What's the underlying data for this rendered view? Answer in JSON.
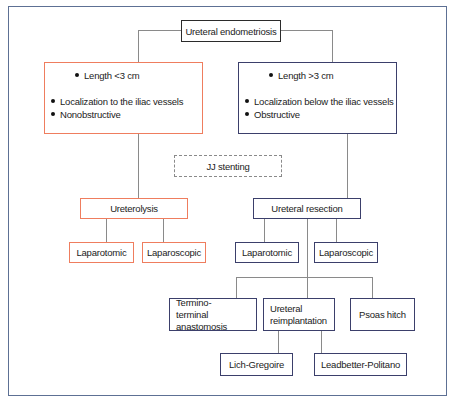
{
  "diagram": {
    "title": "Ureteral endometriosis",
    "left_branch": {
      "criteria": [
        "Length <3 cm",
        "Localization to the iliac vessels",
        "Nonobstructive"
      ],
      "color": "#ef7d5e",
      "treatment": "Ureterolysis",
      "approaches": [
        "Laparotomic",
        "Laparoscopic"
      ]
    },
    "right_branch": {
      "criteria": [
        "Length >3 cm",
        "Localization below the iliac vessels",
        "Obstructive"
      ],
      "color": "#3b3f6b",
      "treatment": "Ureteral resection",
      "approaches": [
        "Laparotomic",
        "Laparoscopic"
      ],
      "techniques": [
        "Termino-terminal anastomosis",
        "Ureteral reimplantation",
        "Psoas hitch"
      ],
      "reimplantation_methods": [
        "Lich-Gregoire",
        "Leadbetter-Politano"
      ]
    },
    "optional": "JJ stenting",
    "frame_color": "#5d7094"
  }
}
